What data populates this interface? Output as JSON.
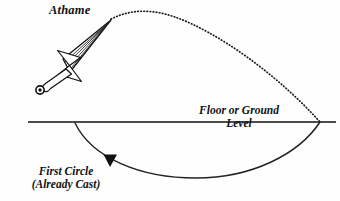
{
  "figure": {
    "type": "diagram",
    "background_color": "#fefefe",
    "ink_color": "#111111",
    "width": 340,
    "height": 201
  },
  "labels": {
    "athame": "Athame",
    "ground_line1": "Floor or Ground",
    "ground_line2": "Level",
    "first_circle_line1": "First Circle",
    "first_circle_line2": "(Already Cast)"
  },
  "elements": {
    "ground_line": {
      "name": "Floor or Ground Level",
      "x_start": 28,
      "x_end": 336,
      "y": 122,
      "style": "solid",
      "stroke_width": 1.3
    },
    "upper_trajectory": {
      "name": "athame swing arc",
      "style": "dotted",
      "start": [
        111,
        19
      ],
      "peak": [
        160,
        10
      ],
      "end": [
        320,
        122
      ],
      "stroke_width": 1.6
    },
    "lower_arc": {
      "name": "first circle already cast",
      "style": "solid",
      "start": [
        75,
        123
      ],
      "nadir": [
        196,
        178
      ],
      "end": [
        320,
        122
      ],
      "stroke_width": 1.4
    },
    "direction_marker": {
      "name": "direction arrowhead",
      "shape": "filled-triangle-down",
      "x": 110,
      "y": 160
    },
    "athame": {
      "name": "athame dagger",
      "blade_tip": [
        111,
        20
      ],
      "guard_center": [
        69,
        66
      ],
      "pommel": [
        40,
        90
      ],
      "pommel_shape": "ring",
      "guard_shape": "bowtie",
      "blade_fuller_lines": 4
    }
  },
  "icons": {
    "arrowhead": "triangle-down-icon",
    "pommel": "ring-icon"
  }
}
